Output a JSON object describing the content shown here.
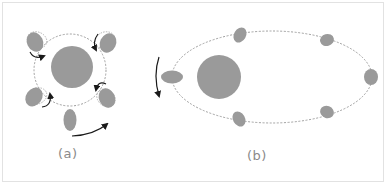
{
  "figure": {
    "panels": [
      {
        "id": "a",
        "label": "(a)",
        "description": "Circular orbit with tidally locked satellite rotating around a central body"
      },
      {
        "id": "b",
        "label": "(b)",
        "description": "Elliptical orbit with satellite positions around an off-center body"
      }
    ]
  },
  "colors": {
    "body_fill": "#9a9a9a",
    "orbit_stroke": "#9c9c9c",
    "arrow_stroke": "#1a1a1a",
    "label_text": "#8a8a8a",
    "frame_border": "#e2e2e2"
  }
}
